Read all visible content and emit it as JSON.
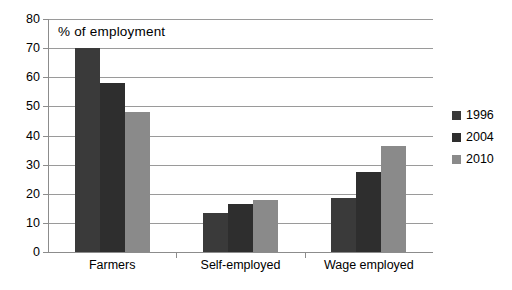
{
  "chart_data": {
    "type": "bar",
    "title": "% of employment",
    "xlabel": "",
    "ylabel": "",
    "ylim": [
      0,
      80
    ],
    "ytick_step": 10,
    "yticks": [
      "80",
      "70",
      "60",
      "50",
      "40",
      "30",
      "20",
      "10",
      "0"
    ],
    "grid": true,
    "legend_position": "right",
    "categories": [
      "Farmers",
      "Self-employed",
      "Wage employed"
    ],
    "series": [
      {
        "name": "1996",
        "color": "#3a3a3a",
        "values": [
          70,
          13.5,
          18.5
        ]
      },
      {
        "name": "2004",
        "color": "#2e2e2e",
        "values": [
          58,
          16.5,
          27.5
        ]
      },
      {
        "name": "2010",
        "color": "#8a8a8a",
        "values": [
          48,
          18,
          36.5
        ]
      }
    ]
  }
}
